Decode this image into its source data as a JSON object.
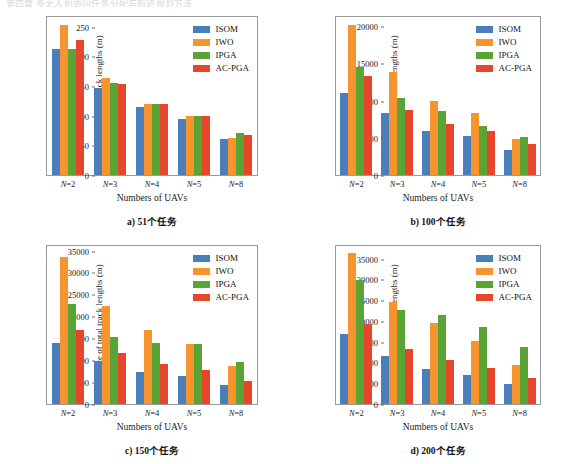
{
  "top_partial_text": "第四章 多无人机协同任务分配与航迹规划方法",
  "legend": {
    "entries": [
      {
        "label": "ISOM",
        "color": "#4a7fbc"
      },
      {
        "label": "IWO",
        "color": "#f7942e"
      },
      {
        "label": "IPGA",
        "color": "#5aa436"
      },
      {
        "label": "AC-PGA",
        "color": "#e8462b"
      }
    ]
  },
  "common": {
    "xlabel": "Numbers of UAVs",
    "ylabel": "Average of total track lengths (m)",
    "categories": [
      "N=2",
      "N=3",
      "N=4",
      "N=5",
      "N=8"
    ]
  },
  "chart_data": [
    {
      "type": "bar",
      "panel_id": "a",
      "caption": "a) 51个任务",
      "title": "",
      "xlabel": "Numbers of UAVs",
      "ylabel": "Average of total track lengths (m)",
      "categories": [
        "N=2",
        "N=3",
        "N=4",
        "N=5",
        "N=8"
      ],
      "ylim": [
        0,
        270
      ],
      "yticks": [
        0,
        50,
        100,
        150,
        200,
        250
      ],
      "grid": false,
      "legend_position": "top-right",
      "series": [
        {
          "name": "ISOM",
          "color": "#4a7fbc",
          "values": [
            216,
            149,
            116,
            95,
            62
          ]
        },
        {
          "name": "IWO",
          "color": "#f7942e",
          "values": [
            257,
            165,
            122,
            100,
            63
          ]
        },
        {
          "name": "IPGA",
          "color": "#5aa436",
          "values": [
            216,
            157,
            122,
            101,
            72
          ]
        },
        {
          "name": "AC-PGA",
          "color": "#e8462b",
          "values": [
            230,
            156,
            121,
            101,
            68
          ]
        }
      ]
    },
    {
      "type": "bar",
      "panel_id": "b",
      "caption": "b) 100个任务",
      "title": "",
      "xlabel": "Numbers of UAVs",
      "ylabel": "Average of total track lengths (m)",
      "categories": [
        "N=2",
        "N=3",
        "N=4",
        "N=5",
        "N=8"
      ],
      "ylim": [
        0,
        21500
      ],
      "yticks": [
        0,
        5000,
        10000,
        15000,
        20000
      ],
      "grid": false,
      "legend_position": "top-right",
      "series": [
        {
          "name": "ISOM",
          "color": "#4a7fbc",
          "values": [
            11100,
            8400,
            6050,
            5250,
            3450
          ]
        },
        {
          "name": "IWO",
          "color": "#f7942e",
          "values": [
            20400,
            14000,
            10050,
            8450,
            4900
          ]
        },
        {
          "name": "IPGA",
          "color": "#5aa436",
          "values": [
            14700,
            10450,
            8750,
            6700,
            5150
          ]
        },
        {
          "name": "AC-PGA",
          "color": "#e8462b",
          "values": [
            13500,
            8900,
            6950,
            5950,
            4250
          ]
        }
      ]
    },
    {
      "type": "bar",
      "panel_id": "c",
      "caption": "c) 150个任务",
      "title": "",
      "xlabel": "Numbers of UAVs",
      "ylabel": "Average of total track lengths (m)",
      "categories": [
        "N=2",
        "N=3",
        "N=4",
        "N=5",
        "N=8"
      ],
      "ylim": [
        0,
        36500
      ],
      "yticks": [
        0,
        5000,
        10000,
        15000,
        20000,
        25000,
        30000,
        35000
      ],
      "grid": false,
      "legend_position": "top-right",
      "series": [
        {
          "name": "ISOM",
          "color": "#4a7fbc",
          "values": [
            14000,
            9950,
            7500,
            6400,
            4350
          ]
        },
        {
          "name": "IWO",
          "color": "#f7942e",
          "values": [
            33900,
            22600,
            17000,
            13800,
            8750
          ]
        },
        {
          "name": "IPGA",
          "color": "#5aa436",
          "values": [
            23000,
            15400,
            14100,
            13900,
            9700
          ]
        },
        {
          "name": "AC-PGA",
          "color": "#e8462b",
          "values": [
            17100,
            11800,
            9350,
            7800,
            5350
          ]
        }
      ]
    },
    {
      "type": "bar",
      "panel_id": "d",
      "caption": "d) 200个任务",
      "title": "",
      "xlabel": "Numbers of UAVs",
      "ylabel": "Average of total track lengths (m)",
      "categories": [
        "N=2",
        "N=3",
        "N=4",
        "N=5",
        "N=8"
      ],
      "ylim": [
        0,
        38500
      ],
      "yticks": [
        0,
        5000,
        10000,
        15000,
        20000,
        25000,
        30000,
        35000
      ],
      "grid": false,
      "legend_position": "top-right",
      "series": [
        {
          "name": "ISOM",
          "color": "#4a7fbc",
          "values": [
            17100,
            11700,
            8500,
            7000,
            4800
          ]
        },
        {
          "name": "IWO",
          "color": "#f7942e",
          "values": [
            36800,
            24800,
            19800,
            15300,
            9600
          ]
        },
        {
          "name": "IPGA",
          "color": "#5aa436",
          "values": [
            30200,
            22900,
            21600,
            18800,
            13800
          ]
        },
        {
          "name": "AC-PGA",
          "color": "#e8462b",
          "values": [
            19400,
            13500,
            10700,
            8800,
            6300
          ]
        }
      ]
    }
  ]
}
